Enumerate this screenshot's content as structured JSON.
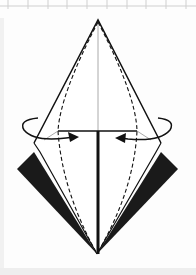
{
  "diagram": {
    "title": "",
    "colors": {
      "line": "#111111",
      "fill_dark": "#1a1a1a",
      "crease": "#aaaaaa",
      "grid": "#cccccc",
      "paper": "#ffffff"
    },
    "elements": [
      {
        "name": "outer-kite-outline",
        "kind": "solid-line"
      },
      {
        "name": "valley-fold-line-left",
        "kind": "dashed-line"
      },
      {
        "name": "valley-fold-line-right",
        "kind": "dashed-line"
      },
      {
        "name": "center-crease",
        "kind": "gray-line"
      },
      {
        "name": "horizontal-edge",
        "kind": "solid-line"
      },
      {
        "name": "center-thick-line",
        "kind": "thick-line"
      },
      {
        "name": "left-dark-flap",
        "kind": "filled-shape"
      },
      {
        "name": "right-dark-flap",
        "kind": "filled-shape"
      },
      {
        "name": "left-fold-arrow",
        "kind": "curved-arrow",
        "direction": "inward"
      },
      {
        "name": "right-fold-arrow",
        "kind": "curved-arrow",
        "direction": "inward"
      }
    ],
    "grid_ticks_top": 10
  }
}
